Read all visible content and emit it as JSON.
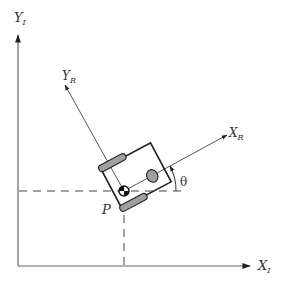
{
  "diagram": {
    "colors": {
      "line": "#555555",
      "body": "#222222",
      "wheel_fill": "#a0a0a0",
      "background": "#ffffff"
    },
    "labels": {
      "inertial_y_main": "Y",
      "inertial_y_sub": "I",
      "inertial_x_main": "X",
      "inertial_x_sub": "I",
      "robot_y_main": "Y",
      "robot_y_sub": "R",
      "robot_x_main": "X",
      "robot_x_sub": "R",
      "point": "P",
      "angle": "θ"
    },
    "elements": [
      {
        "name": "inertial-x-axis",
        "type": "arrow"
      },
      {
        "name": "inertial-y-axis",
        "type": "arrow"
      },
      {
        "name": "robot-x-axis",
        "type": "arrow"
      },
      {
        "name": "robot-y-axis",
        "type": "arrow"
      },
      {
        "name": "dashed-horizontal-projection",
        "type": "dashed-line"
      },
      {
        "name": "dashed-vertical-projection",
        "type": "dashed-line"
      },
      {
        "name": "robot-chassis",
        "type": "rotated-rectangle"
      },
      {
        "name": "left-wheel",
        "type": "wheel"
      },
      {
        "name": "right-wheel",
        "type": "wheel"
      },
      {
        "name": "caster-wheel",
        "type": "circle"
      },
      {
        "name": "reference-point-p",
        "type": "point"
      },
      {
        "name": "theta-angle-arc",
        "type": "arc"
      }
    ]
  }
}
